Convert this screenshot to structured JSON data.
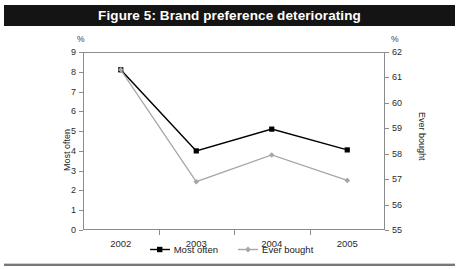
{
  "figure": {
    "title": "Figure 5: Brand preference deteriorating"
  },
  "axes": {
    "left_unit": "%",
    "right_unit": "%",
    "left_title": "Most often",
    "right_title": "Ever bought",
    "left_ticks": [
      "9",
      "8",
      "7",
      "6",
      "5",
      "4",
      "3",
      "2",
      "1",
      "0"
    ],
    "right_ticks": [
      "62",
      "61",
      "60",
      "59",
      "58",
      "57",
      "56",
      "55"
    ],
    "x_ticks": [
      "2002",
      "2003",
      "2004",
      "2005"
    ]
  },
  "legend": {
    "items": [
      {
        "label": "Most often",
        "color": "#000000"
      },
      {
        "label": "Ever bought",
        "color": "#a6a6a6"
      }
    ]
  },
  "colors": {
    "most_often": "#000000",
    "ever_bought": "#a6a6a6",
    "frame": "#8c8c8c",
    "title_bar": "#141414",
    "background": "#ffffff"
  },
  "chart_data": {
    "type": "line",
    "title": "Figure 5: Brand preference deteriorating",
    "xlabel": "",
    "ylabel": "Most often",
    "y2label": "Ever bought",
    "categories": [
      "2002",
      "2003",
      "2004",
      "2005"
    ],
    "ylim": [
      0,
      9
    ],
    "y2lim": [
      55,
      62
    ],
    "yticks": [
      0,
      1,
      2,
      3,
      4,
      5,
      6,
      7,
      8,
      9
    ],
    "y2ticks": [
      55,
      56,
      57,
      58,
      59,
      60,
      61,
      62
    ],
    "grid": false,
    "legend_position": "bottom-center",
    "series": [
      {
        "name": "Most often",
        "axis": "left",
        "unit": "%",
        "color": "#000000",
        "marker": "square",
        "values": [
          8.1,
          4.0,
          5.1,
          4.05
        ]
      },
      {
        "name": "Ever bought",
        "axis": "right",
        "unit": "%",
        "color": "#a6a6a6",
        "marker": "diamond",
        "values": [
          61.3,
          56.9,
          57.95,
          56.95
        ]
      }
    ]
  }
}
